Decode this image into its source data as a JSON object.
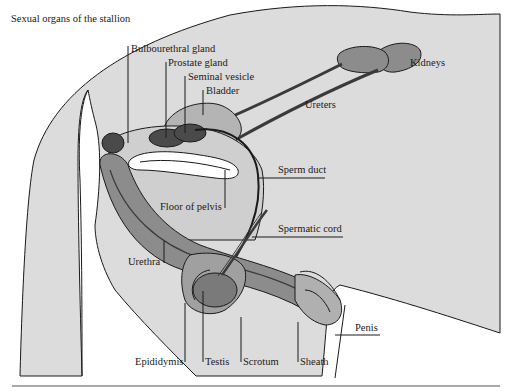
{
  "title": "Sexual organs of the stallion",
  "colors": {
    "body_fill": "#dcdcdc",
    "organ_mid": "#8c8c8c",
    "organ_light": "#b4b4b4",
    "organ_dark": "#4a4a4a",
    "line": "#1a1a1a"
  },
  "labels": {
    "bulbourethral_gland": "Bulbourethral gland",
    "prostate_gland": "Prostate gland",
    "seminal_vesicle": "Seminal vesicle",
    "bladder": "Bladder",
    "kidneys": "Kidneys",
    "ureters": "Ureters",
    "sperm_duct": "Sperm duct",
    "floor_of_pelvis": "Floor of pelvis",
    "spermatic_cord": "Spermatic cord",
    "urethra": "Urethra",
    "penis": "Penis",
    "epididymis": "Epididymis",
    "testis": "Testis",
    "scrotum": "Scrotum",
    "sheath": "Sheath"
  }
}
